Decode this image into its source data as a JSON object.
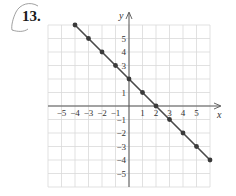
{
  "problem": {
    "number": "13."
  },
  "chart_data": {
    "type": "line",
    "title": "",
    "xlabel": "x",
    "ylabel": "y",
    "xlim": [
      -6,
      6
    ],
    "ylim": [
      -6,
      6
    ],
    "grid": true,
    "x_ticks": [
      -5,
      -4,
      -3,
      -2,
      -1,
      1,
      2,
      3,
      4,
      5
    ],
    "y_ticks": [
      5,
      4,
      3,
      1,
      -1,
      -2,
      -3,
      -4,
      -5
    ],
    "x_tick_labels": [
      "−5",
      "−4",
      "−3",
      "−2",
      "−1",
      "1",
      "2",
      "3",
      "4",
      "5"
    ],
    "y_tick_labels": [
      "5",
      "4",
      "3",
      "1",
      "−1",
      "−2",
      "−3",
      "−4",
      "−5"
    ],
    "series": [
      {
        "name": "y = 2 − x",
        "x": [
          -4,
          -3,
          -2,
          -1,
          0,
          1,
          2,
          3,
          4,
          5,
          6
        ],
        "y": [
          6,
          5,
          4,
          3,
          2,
          1,
          0,
          -1,
          -2,
          -3,
          -4
        ]
      }
    ],
    "colors": {
      "line": "#4a4a4a",
      "point": "#3a3a3a",
      "grid": "#d9d9d9",
      "axis": "#555555"
    }
  }
}
